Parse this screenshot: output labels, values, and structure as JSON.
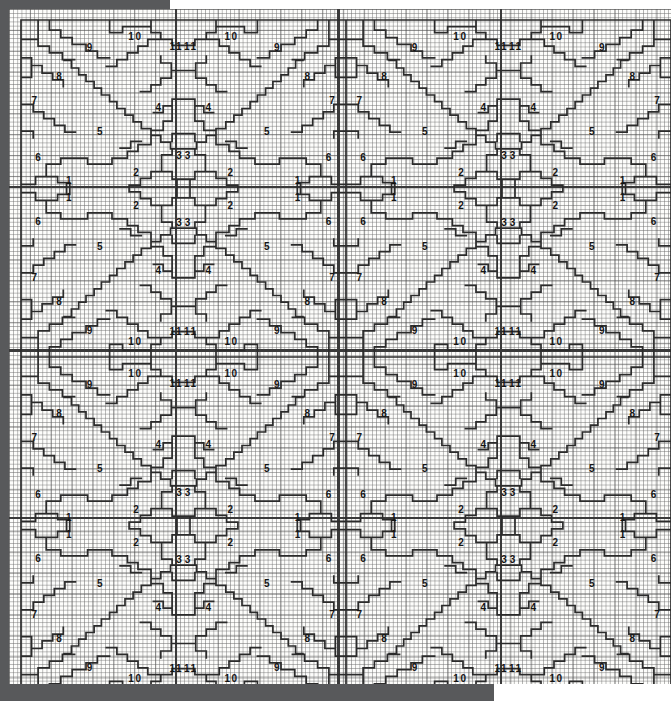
{
  "document": {
    "kind": "quilt-charting-diagram",
    "title": "Feathered star block charting diagram",
    "description": "Graph-paper chart showing a four-fold symmetric pieced block repeated two across and two down, with eleven numbered template regions per quadrant.",
    "grid": {
      "cell_px": 4.18,
      "heavy_rule_every": 5,
      "columns": 158,
      "rows": 161
    },
    "blocks": {
      "across": 2,
      "down": 2
    },
    "quadrants_per_block": 4,
    "region_numbers": [
      "1",
      "2",
      "3",
      "4",
      "5",
      "6",
      "7",
      "8",
      "9",
      "10",
      "11"
    ]
  },
  "colors": {
    "paper": "#fdfdfb",
    "fine_grid": "#6e6e6e",
    "heavy_grid": "#464646",
    "outline": "#2b2b2b",
    "scan_edge": "#58595b",
    "number_text": "#141414"
  },
  "legend_note": "",
  "quadrant_labels": [
    {
      "n": "10",
      "x": 0.352,
      "y": 0.048
    },
    {
      "n": "11",
      "x": 0.478,
      "y": 0.077
    },
    {
      "n": "9",
      "x": 0.212,
      "y": 0.08
    },
    {
      "n": "8",
      "x": 0.118,
      "y": 0.165
    },
    {
      "n": "7",
      "x": 0.042,
      "y": 0.238
    },
    {
      "n": "6",
      "x": 0.053,
      "y": 0.405
    },
    {
      "n": "5",
      "x": 0.243,
      "y": 0.33
    },
    {
      "n": "4",
      "x": 0.423,
      "y": 0.258
    },
    {
      "n": "3",
      "x": 0.487,
      "y": 0.4
    },
    {
      "n": "2",
      "x": 0.355,
      "y": 0.45
    },
    {
      "n": "1",
      "x": 0.148,
      "y": 0.475
    }
  ],
  "block_layout": {
    "block_origin_x": 12,
    "block_origin_y": 11,
    "block_width": 325,
    "block_height": 337,
    "quadrant_width": 162.5,
    "quadrant_height": 168.5
  }
}
